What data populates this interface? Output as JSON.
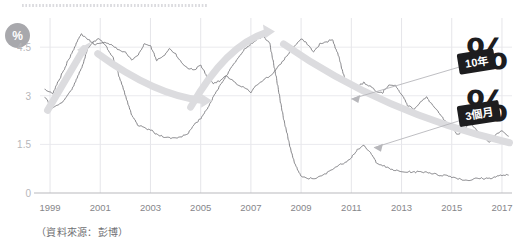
{
  "axis_unit_badge": "%",
  "source_note": "（資料來源：彭博）",
  "chart_data": {
    "type": "line",
    "title": "",
    "subtitle": "",
    "xlabel": "",
    "ylabel": "%",
    "grid": true,
    "legend_position": "annotation-stickers",
    "xlim": [
      1998.6,
      2017.4
    ],
    "ylim": [
      0,
      5.4
    ],
    "yticks": [
      0,
      1.5,
      3,
      4.5
    ],
    "ytick_labels": [
      "0",
      "1.5",
      "3",
      "4.5"
    ],
    "xticks": [
      1999,
      2001,
      2003,
      2005,
      2007,
      2009,
      2011,
      2013,
      2015,
      2017
    ],
    "xtick_labels": [
      "1999",
      "2001",
      "2003",
      "2005",
      "2007",
      "2009",
      "2011",
      "2013",
      "2015",
      "2017"
    ],
    "series": [
      {
        "name": "10年",
        "name_en": "10-year",
        "color": "#6e6e73",
        "x": [
          1998.8,
          1999.1,
          1999.4,
          1999.7,
          2000.0,
          2000.25,
          2000.5,
          2000.75,
          2001.0,
          2001.25,
          2001.5,
          2001.75,
          2002.0,
          2002.25,
          2002.5,
          2002.75,
          2003.0,
          2003.25,
          2003.5,
          2003.75,
          2004.0,
          2004.25,
          2004.5,
          2004.75,
          2005.0,
          2005.25,
          2005.5,
          2005.75,
          2006.0,
          2006.25,
          2006.5,
          2006.75,
          2007.0,
          2007.25,
          2007.5,
          2007.75,
          2008.0,
          2008.25,
          2008.5,
          2008.75,
          2009.0,
          2009.25,
          2009.5,
          2009.75,
          2010.0,
          2010.25,
          2010.5,
          2010.75,
          2011.0,
          2011.25,
          2011.5,
          2011.75,
          2012.0,
          2012.25,
          2012.5,
          2012.75,
          2013.0,
          2013.25,
          2013.5,
          2013.75,
          2014.0,
          2014.25,
          2014.5,
          2014.75,
          2015.0,
          2015.25,
          2015.5,
          2015.75,
          2016.0,
          2016.25,
          2016.5,
          2016.75,
          2017.0,
          2017.25
        ],
        "values": [
          3.2,
          3.05,
          3.55,
          4.05,
          4.55,
          4.9,
          4.75,
          4.6,
          4.6,
          4.65,
          4.55,
          4.4,
          4.35,
          4.1,
          4.25,
          4.6,
          4.55,
          4.1,
          4.2,
          4.45,
          4.3,
          4.0,
          3.85,
          3.8,
          3.95,
          3.6,
          3.4,
          3.45,
          3.6,
          3.5,
          3.3,
          3.25,
          3.1,
          3.35,
          3.5,
          3.6,
          3.8,
          4.05,
          4.3,
          4.55,
          4.75,
          4.6,
          4.35,
          4.6,
          4.65,
          4.75,
          4.2,
          3.5,
          3.35,
          3.3,
          3.4,
          3.3,
          3.15,
          3.1,
          3.35,
          3.3,
          3.05,
          2.7,
          2.6,
          2.8,
          2.95,
          2.7,
          2.45,
          2.2,
          2.0,
          1.8,
          2.0,
          2.15,
          1.95,
          1.75,
          1.55,
          1.8,
          1.95,
          1.75
        ],
        "note": "10-year government bond yield — peaks near 4.9% around 2000 and again near 4.75% in 2007, declines to roughly 1.8% by 2017"
      },
      {
        "name": "3個月",
        "name_en": "3-month",
        "color": "#6e6e73",
        "x": [
          1998.8,
          1999.1,
          1999.4,
          1999.7,
          2000.0,
          2000.25,
          2000.5,
          2000.75,
          2001.0,
          2001.25,
          2001.5,
          2001.75,
          2002.0,
          2002.25,
          2002.5,
          2002.75,
          2003.0,
          2003.25,
          2003.5,
          2003.75,
          2004.0,
          2004.25,
          2004.5,
          2004.75,
          2005.0,
          2005.25,
          2005.5,
          2005.75,
          2006.0,
          2006.25,
          2006.5,
          2006.75,
          2007.0,
          2007.25,
          2007.5,
          2007.75,
          2008.0,
          2008.25,
          2008.5,
          2008.75,
          2009.0,
          2009.25,
          2009.5,
          2009.75,
          2010.0,
          2010.25,
          2010.5,
          2010.75,
          2011.0,
          2011.25,
          2011.5,
          2011.75,
          2012.0,
          2012.25,
          2012.5,
          2012.75,
          2013.0,
          2013.25,
          2013.5,
          2013.75,
          2014.0,
          2014.25,
          2014.5,
          2014.75,
          2015.0,
          2015.25,
          2015.5,
          2015.75,
          2016.0,
          2016.25,
          2016.5,
          2016.75,
          2017.0,
          2017.25
        ],
        "values": [
          2.95,
          2.6,
          2.75,
          3.0,
          3.4,
          3.85,
          4.45,
          4.7,
          4.75,
          4.5,
          4.2,
          3.6,
          3.0,
          2.4,
          2.1,
          2.0,
          1.95,
          1.8,
          1.75,
          1.7,
          1.7,
          1.75,
          1.85,
          2.1,
          2.3,
          2.6,
          2.95,
          3.3,
          3.6,
          3.9,
          4.2,
          4.45,
          4.6,
          4.75,
          4.85,
          4.6,
          3.6,
          2.5,
          1.6,
          0.9,
          0.5,
          0.45,
          0.45,
          0.5,
          0.6,
          0.75,
          0.85,
          0.95,
          1.1,
          1.35,
          1.45,
          1.25,
          0.95,
          0.85,
          0.75,
          0.7,
          0.65,
          0.65,
          0.65,
          0.65,
          0.65,
          0.6,
          0.55,
          0.55,
          0.5,
          0.45,
          0.4,
          0.4,
          0.45,
          0.45,
          0.45,
          0.5,
          0.55,
          0.55
        ],
        "note": "3-month rate — tracks above the 10-year near 2000 and 2007, collapses to near zero after 2009"
      }
    ],
    "annotations": [
      {
        "name": "up-arrow-1999-2000",
        "type": "arrow",
        "style": "thick-gray",
        "from": {
          "x": 1998.9,
          "y": 2.55
        },
        "to": {
          "x": 2000.35,
          "y": 4.45
        }
      },
      {
        "name": "down-arrow-2000-2005",
        "type": "arrow",
        "style": "thick-gray-curve",
        "from": {
          "x": 2000.9,
          "y": 4.3
        },
        "to": {
          "x": 2005.1,
          "y": 2.85
        }
      },
      {
        "name": "up-arrow-2004-2007",
        "type": "arrow",
        "style": "thick-gray-curve",
        "from": {
          "x": 2004.6,
          "y": 2.65
        },
        "to": {
          "x": 2007.6,
          "y": 4.95
        }
      },
      {
        "name": "down-curve-2008-2017",
        "type": "curve",
        "style": "thick-gray-curve",
        "from": {
          "x": 2008.3,
          "y": 4.6
        },
        "to": {
          "x": 2017.3,
          "y": 1.55
        }
      },
      {
        "name": "leader-10y",
        "type": "leader-line",
        "to": {
          "x": 2011.0,
          "y": 2.9
        }
      },
      {
        "name": "leader-3m",
        "type": "leader-line",
        "to": {
          "x": 2011.9,
          "y": 1.4
        }
      }
    ]
  },
  "stickers": [
    {
      "id": "10y",
      "glyph": "%",
      "tag": "10年"
    },
    {
      "id": "3m",
      "glyph": "%",
      "tag": "3個月"
    }
  ]
}
